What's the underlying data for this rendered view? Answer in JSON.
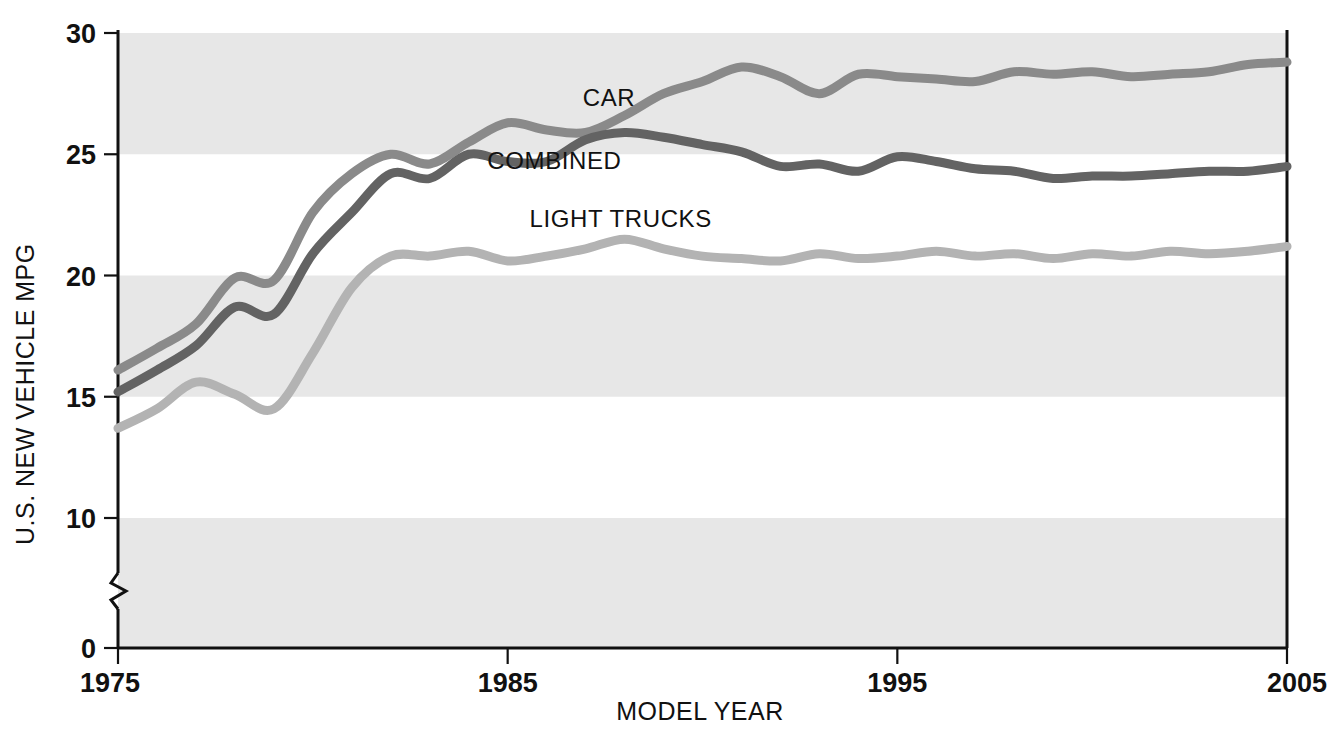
{
  "chart_data": {
    "type": "line",
    "title": "",
    "xlabel": "MODEL YEAR",
    "ylabel": "U.S. NEW VEHICLE MPG",
    "xlim": [
      1975,
      2005
    ],
    "ylim": [
      0,
      30
    ],
    "y_axis_break": true,
    "y_break_between": [
      0,
      10
    ],
    "grid": "horizontal-shaded-bands",
    "legend_position": "inline-labels",
    "x_ticks": [
      "1975",
      "1985",
      "1995",
      "2005"
    ],
    "x_tick_values": [
      1975,
      1985,
      1995,
      2005
    ],
    "y_ticks": [
      "0",
      "10",
      "15",
      "20",
      "25",
      "30"
    ],
    "y_tick_values": [
      0,
      10,
      15,
      20,
      25,
      30
    ],
    "shaded_bands": [
      [
        25,
        30
      ],
      [
        15,
        20
      ],
      [
        0,
        10
      ]
    ],
    "x": [
      1975,
      1976,
      1977,
      1978,
      1979,
      1980,
      1981,
      1982,
      1983,
      1984,
      1985,
      1986,
      1987,
      1988,
      1989,
      1990,
      1991,
      1992,
      1993,
      1994,
      1995,
      1996,
      1997,
      1998,
      1999,
      2000,
      2001,
      2002,
      2003,
      2004,
      2005
    ],
    "series": [
      {
        "name": "CAR",
        "color": "#8a8a8a",
        "values": [
          16.1,
          17.0,
          18.0,
          19.9,
          19.8,
          22.6,
          24.2,
          25.0,
          24.6,
          25.5,
          26.3,
          26.0,
          25.9,
          26.6,
          27.5,
          28.0,
          28.6,
          28.2,
          27.5,
          28.3,
          28.2,
          28.1,
          28.0,
          28.4,
          28.3,
          28.4,
          28.2,
          28.3,
          28.4,
          28.7,
          28.8
        ]
      },
      {
        "name": "COMBINED",
        "color": "#636363",
        "values": [
          15.2,
          16.1,
          17.1,
          18.7,
          18.4,
          20.9,
          22.6,
          24.2,
          24.0,
          25.0,
          24.7,
          24.7,
          25.6,
          25.9,
          25.7,
          25.4,
          25.1,
          24.5,
          24.6,
          24.3,
          24.9,
          24.7,
          24.4,
          24.3,
          24.0,
          24.1,
          24.1,
          24.2,
          24.3,
          24.3,
          24.5
        ]
      },
      {
        "name": "LIGHT TRUCKS",
        "color": "#b3b3b3",
        "values": [
          13.7,
          14.5,
          15.6,
          15.1,
          14.5,
          16.8,
          19.5,
          20.8,
          20.8,
          21.0,
          20.6,
          20.8,
          21.1,
          21.5,
          21.1,
          20.8,
          20.7,
          20.6,
          20.9,
          20.7,
          20.8,
          21.0,
          20.8,
          20.9,
          20.7,
          20.9,
          20.8,
          21.0,
          20.9,
          21.0,
          21.2
        ]
      }
    ],
    "annotations": [
      {
        "text": "CAR",
        "x": 1987.6,
        "y": 27.0
      },
      {
        "text": "COMBINED",
        "x": 1986.2,
        "y": 24.4
      },
      {
        "text": "LIGHT TRUCKS",
        "x": 1987.9,
        "y": 22.0
      }
    ]
  },
  "colors": {
    "band": "#e7e7e7",
    "axis": "#111111",
    "car": "#8a8a8a",
    "combined": "#636363",
    "light_trucks": "#b3b3b3",
    "background": "#ffffff"
  },
  "axes": {
    "y_title": "U.S. NEW VEHICLE MPG",
    "x_title": "MODEL YEAR",
    "y_labels": [
      "30",
      "25",
      "20",
      "15",
      "10",
      "0"
    ],
    "x_labels": [
      "1975",
      "1985",
      "1995",
      "2005"
    ]
  },
  "labels": {
    "car": "CAR",
    "combined": "COMBINED",
    "light_trucks": "LIGHT TRUCKS"
  }
}
